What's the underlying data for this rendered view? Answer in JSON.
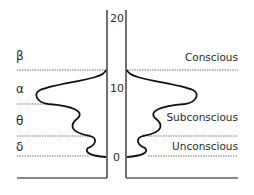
{
  "diagram": {
    "axis": {
      "ticks": [
        {
          "label": "20",
          "y": 20
        },
        {
          "label": "10",
          "y": 10
        },
        {
          "label": "0",
          "y": 0
        }
      ]
    },
    "left_bands": [
      {
        "symbol": "β",
        "name": "beta"
      },
      {
        "symbol": "α",
        "name": "alpha"
      },
      {
        "symbol": "θ",
        "name": "theta"
      },
      {
        "symbol": "δ",
        "name": "delta"
      }
    ],
    "right_bands": [
      {
        "label": "Conscious"
      },
      {
        "label": "Subconscious"
      },
      {
        "label": "Unconscious"
      }
    ],
    "colors": {
      "line": "#111111",
      "dotted": "#777777",
      "text": "#2a2a2a",
      "background": "#ffffff"
    }
  }
}
